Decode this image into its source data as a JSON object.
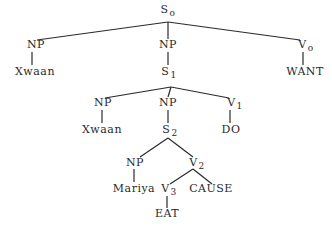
{
  "diagram": {
    "type": "syntax-tree",
    "nodes": [
      {
        "id": "S0",
        "label": "S",
        "sub": "o",
        "x": 168,
        "y": 4
      },
      {
        "id": "NP_a",
        "label": "NP",
        "sub": "",
        "x": 36,
        "y": 39
      },
      {
        "id": "Xwaan_a",
        "label": "Xwaan",
        "sub": "",
        "x": 35,
        "y": 66
      },
      {
        "id": "NP_b",
        "label": "NP",
        "sub": "",
        "x": 168,
        "y": 39
      },
      {
        "id": "S1",
        "label": "S",
        "sub": "1",
        "x": 169,
        "y": 66
      },
      {
        "id": "V0",
        "label": "V",
        "sub": "o",
        "x": 306,
        "y": 39
      },
      {
        "id": "WANT",
        "label": "WANT",
        "sub": "",
        "x": 305,
        "y": 66
      },
      {
        "id": "NP_c",
        "label": "NP",
        "sub": "",
        "x": 103,
        "y": 97
      },
      {
        "id": "Xwaan_b",
        "label": "Xwaan",
        "sub": "",
        "x": 102,
        "y": 124
      },
      {
        "id": "NP_d",
        "label": "NP",
        "sub": "",
        "x": 168,
        "y": 97
      },
      {
        "id": "S2",
        "label": "S",
        "sub": "2",
        "x": 170,
        "y": 124
      },
      {
        "id": "V1",
        "label": "V",
        "sub": "1",
        "x": 235,
        "y": 97
      },
      {
        "id": "DO",
        "label": "DO",
        "sub": "",
        "x": 231,
        "y": 124
      },
      {
        "id": "NP_e",
        "label": "NP",
        "sub": "",
        "x": 135,
        "y": 157
      },
      {
        "id": "Mariya",
        "label": "Mariya",
        "sub": "",
        "x": 134,
        "y": 183
      },
      {
        "id": "V2",
        "label": "V",
        "sub": "2",
        "x": 197,
        "y": 157
      },
      {
        "id": "V3",
        "label": "V",
        "sub": "3",
        "x": 169,
        "y": 183
      },
      {
        "id": "CAUSE",
        "label": "CAUSE",
        "sub": "",
        "x": 211,
        "y": 183
      },
      {
        "id": "EAT",
        "label": "EAT",
        "sub": "",
        "x": 167,
        "y": 208
      }
    ],
    "edges": [
      {
        "x1": 168,
        "y1": 22,
        "x2": 37,
        "y2": 40
      },
      {
        "x1": 168,
        "y1": 22,
        "x2": 168,
        "y2": 39
      },
      {
        "x1": 168,
        "y1": 22,
        "x2": 300,
        "y2": 40
      },
      {
        "x1": 32,
        "y1": 52,
        "x2": 32,
        "y2": 65
      },
      {
        "x1": 168,
        "y1": 52,
        "x2": 168,
        "y2": 65
      },
      {
        "x1": 303,
        "y1": 52,
        "x2": 303,
        "y2": 65
      },
      {
        "x1": 171,
        "y1": 87,
        "x2": 105,
        "y2": 98
      },
      {
        "x1": 171,
        "y1": 87,
        "x2": 168,
        "y2": 97
      },
      {
        "x1": 171,
        "y1": 87,
        "x2": 229,
        "y2": 98
      },
      {
        "x1": 102,
        "y1": 110,
        "x2": 102,
        "y2": 123
      },
      {
        "x1": 168,
        "y1": 110,
        "x2": 168,
        "y2": 123
      },
      {
        "x1": 230,
        "y1": 110,
        "x2": 230,
        "y2": 123
      },
      {
        "x1": 168,
        "y1": 138,
        "x2": 140,
        "y2": 157
      },
      {
        "x1": 168,
        "y1": 138,
        "x2": 193,
        "y2": 157
      },
      {
        "x1": 134,
        "y1": 169,
        "x2": 134,
        "y2": 182
      },
      {
        "x1": 193,
        "y1": 169,
        "x2": 170,
        "y2": 184
      },
      {
        "x1": 193,
        "y1": 169,
        "x2": 212,
        "y2": 184
      },
      {
        "x1": 167,
        "y1": 196,
        "x2": 167,
        "y2": 208
      }
    ]
  }
}
